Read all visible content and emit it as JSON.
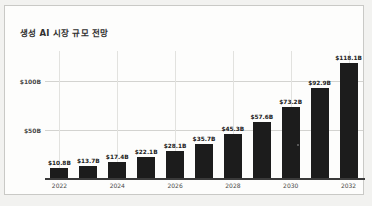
{
  "chart_data": {
    "type": "bar",
    "title": "생성 AI 시장 규모 전망",
    "xlabel": "",
    "ylabel": "",
    "categories": [
      "2022",
      "2023",
      "2024",
      "2025",
      "2026",
      "2027",
      "2028",
      "2029",
      "2030",
      "2031",
      "2032"
    ],
    "values": [
      10.8,
      13.7,
      17.4,
      22.1,
      28.1,
      35.7,
      45.3,
      57.6,
      73.2,
      92.9,
      118.1
    ],
    "data_labels": [
      "$10.8B",
      "$13.7B",
      "$17.4B",
      "$22.1B",
      "$28.1B",
      "$35.7B",
      "$45.3B",
      "$57.6B",
      "$73.2B",
      "$92.9B",
      "$118.1B"
    ],
    "x_tick_labels": [
      "2022",
      "",
      "2024",
      "",
      "2026",
      "",
      "2028",
      "",
      "2030",
      "",
      "2032"
    ],
    "y_ticks": [
      50,
      100
    ],
    "y_tick_labels": [
      "$50B",
      "$100B"
    ],
    "ylim": [
      0,
      130
    ],
    "grid": true,
    "legend": false,
    "bar_color": "#1c1c1c",
    "gridline_color": "#d3d3d0",
    "background_color": "#fdfdfc",
    "text_color": "#303030"
  }
}
